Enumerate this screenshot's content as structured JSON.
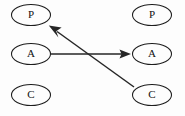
{
  "diagram": {
    "background_color": "#fdfdfd",
    "node_stroke_color": "#1d1d1d",
    "edge_color": "#262626",
    "label_color": "#111111",
    "columns": [
      {
        "name": "left-column",
        "nodes": [
          {
            "id": "left-p",
            "label": "P",
            "cx": 31,
            "cy": 15,
            "rx": 19.5,
            "ry": 10.5
          },
          {
            "id": "left-a",
            "label": "A",
            "cx": 31,
            "cy": 54,
            "rx": 19.5,
            "ry": 10.5
          },
          {
            "id": "left-c",
            "label": "C",
            "cx": 31,
            "cy": 95,
            "rx": 19.5,
            "ry": 10.5
          }
        ]
      },
      {
        "name": "right-column",
        "nodes": [
          {
            "id": "right-p",
            "label": "P",
            "cx": 152,
            "cy": 15,
            "rx": 19.5,
            "ry": 10.5
          },
          {
            "id": "right-a",
            "label": "A",
            "cx": 152,
            "cy": 54,
            "rx": 19.5,
            "ry": 10.5
          },
          {
            "id": "right-c",
            "label": "C",
            "cx": 152,
            "cy": 95,
            "rx": 19.5,
            "ry": 10.5
          }
        ]
      }
    ],
    "edges": [
      {
        "id": "edge-a-to-a",
        "from": "left-a",
        "to": "right-a",
        "orientation": "horizontal",
        "x1": 51,
        "y1": 54,
        "x2": 131,
        "y2": 54,
        "arrowhead": "end"
      },
      {
        "id": "edge-c-to-p",
        "from": "right-c",
        "to": "left-p",
        "orientation": "diagonal",
        "x1": 134,
        "y1": 87,
        "x2": 49,
        "y2": 26,
        "arrowhead": "end"
      }
    ]
  }
}
